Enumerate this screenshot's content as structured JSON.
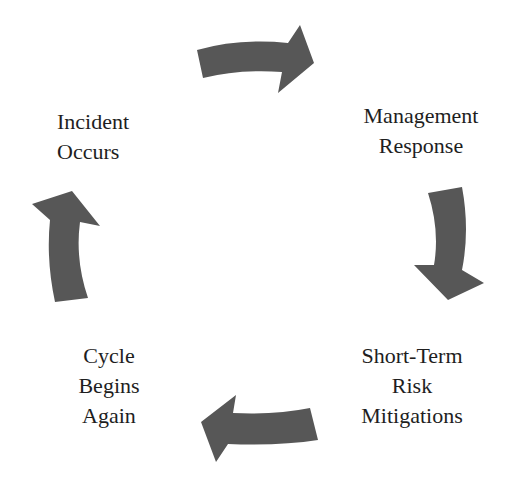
{
  "diagram": {
    "type": "cycle",
    "arrow_color": "#575757",
    "text_color": "#1e1e1e",
    "stages": [
      {
        "id": "incident",
        "lines": [
          "Incident",
          "Occurs"
        ]
      },
      {
        "id": "management",
        "lines": [
          "Management",
          "Response"
        ]
      },
      {
        "id": "mitigations",
        "lines": [
          "Short-Term",
          "Risk",
          "Mitigations"
        ]
      },
      {
        "id": "cycle",
        "lines": [
          "Cycle",
          "Begins",
          "Again"
        ]
      }
    ],
    "arrows": [
      {
        "from": "incident",
        "to": "management",
        "direction": "right"
      },
      {
        "from": "management",
        "to": "mitigations",
        "direction": "down"
      },
      {
        "from": "mitigations",
        "to": "cycle",
        "direction": "left"
      },
      {
        "from": "cycle",
        "to": "incident",
        "direction": "up"
      }
    ]
  }
}
